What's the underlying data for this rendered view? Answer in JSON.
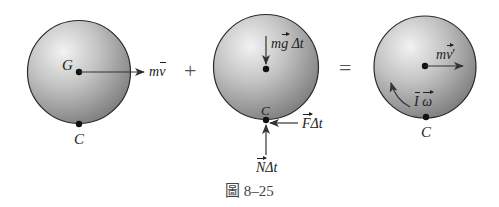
{
  "figure": {
    "caption_prefix": "圖",
    "caption_number": "8–25"
  },
  "operators": {
    "plus": "+",
    "equals": "="
  },
  "panel1": {
    "center_label": "G",
    "contact_label": "C",
    "momentum_m": "m",
    "momentum_v": "v"
  },
  "panel2": {
    "weight_m": "m",
    "weight_g": "g",
    "weight_dt": "Δt",
    "contact_label": "C",
    "friction_F": "F",
    "friction_dt": "Δt",
    "normal_N": "N",
    "normal_dt": "Δt"
  },
  "panel3": {
    "momentum_m": "m",
    "momentum_v": "v",
    "momentum_prime": "′",
    "angular_I": "I",
    "angular_omega": "ω",
    "contact_label": "C"
  },
  "colors": {
    "sphere_highlight": "#f2f2f2",
    "sphere_mid": "#bdbdbd",
    "sphere_shadow": "#7e7e7e",
    "outline": "#2a2a2a",
    "arrow": "#333333"
  }
}
